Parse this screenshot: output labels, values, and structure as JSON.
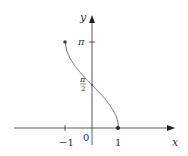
{
  "chart_data": {
    "type": "line",
    "title": "",
    "function": "y = arccos(x)",
    "xlabel": "x",
    "ylabel": "y",
    "xlim": [
      -1.6,
      2.1
    ],
    "ylim": [
      -0.3,
      3.9
    ],
    "x_ticks": [
      {
        "value": -1,
        "label": "−1"
      },
      {
        "value": 0,
        "label": "0"
      },
      {
        "value": 1,
        "label": "1"
      }
    ],
    "y_ticks": [
      {
        "value": 1.5708,
        "label_num": "π",
        "label_den": "2"
      },
      {
        "value": 3.1416,
        "label": "π"
      }
    ],
    "endpoints": [
      {
        "x": -1,
        "y": 3.1416
      },
      {
        "x": 1,
        "y": 0
      }
    ],
    "marked_points": [
      {
        "x": 0,
        "y": 1.5708
      }
    ],
    "grid": false,
    "legend": null
  },
  "colors": {
    "axis": "#333333",
    "curve": "#6b6b6b",
    "text": "#333333"
  }
}
